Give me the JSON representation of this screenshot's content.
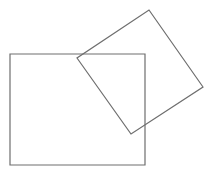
{
  "diagram": {
    "width": 216,
    "height": 172,
    "background": "#ffffff",
    "stroke_color": "#6e6e6e",
    "stroke_width": 1.2,
    "shapes": [
      {
        "name": "upright-rectangle",
        "type": "polygon",
        "points": [
          [
            10,
            54
          ],
          [
            145,
            54
          ],
          [
            145,
            165
          ],
          [
            10,
            165
          ]
        ]
      },
      {
        "name": "tilted-square",
        "type": "polygon",
        "points": [
          [
            149,
            10
          ],
          [
            203,
            87
          ],
          [
            131,
            134
          ],
          [
            77,
            58
          ]
        ]
      }
    ]
  }
}
